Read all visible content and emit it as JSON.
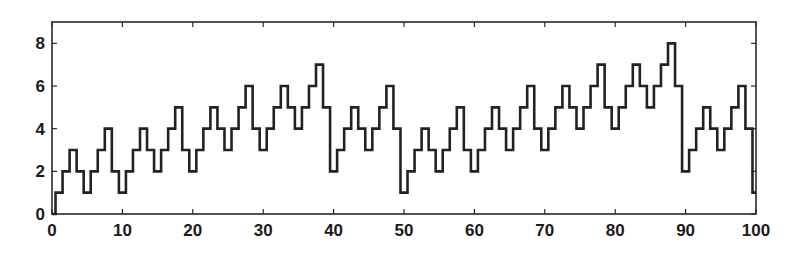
{
  "chart_data": {
    "type": "line",
    "style": "stairs-centered",
    "title": "",
    "xlabel": "",
    "ylabel": "",
    "xlim": [
      0,
      100
    ],
    "ylim": [
      0,
      9
    ],
    "xticks": [
      0,
      10,
      20,
      30,
      40,
      50,
      60,
      70,
      80,
      90,
      100
    ],
    "yticks": [
      0,
      2,
      4,
      6,
      8
    ],
    "grid": false,
    "legend": null,
    "series": [
      {
        "name": "series-1",
        "color": "#222222",
        "x": [
          0,
          1,
          2,
          3,
          4,
          5,
          6,
          7,
          8,
          9,
          10,
          11,
          12,
          13,
          14,
          15,
          16,
          17,
          18,
          19,
          20,
          21,
          22,
          23,
          24,
          25,
          26,
          27,
          28,
          29,
          30,
          31,
          32,
          33,
          34,
          35,
          36,
          37,
          38,
          39,
          40,
          41,
          42,
          43,
          44,
          45,
          46,
          47,
          48,
          49,
          50,
          51,
          52,
          53,
          54,
          55,
          56,
          57,
          58,
          59,
          60,
          61,
          62,
          63,
          64,
          65,
          66,
          67,
          68,
          69,
          70,
          71,
          72,
          73,
          74,
          75,
          76,
          77,
          78,
          79,
          80,
          81,
          82,
          83,
          84,
          85,
          86,
          87,
          88,
          89,
          90,
          91,
          92,
          93,
          94,
          95,
          96,
          97,
          98,
          99,
          100
        ],
        "values": [
          0,
          1,
          2,
          3,
          2,
          1,
          2,
          3,
          4,
          2,
          1,
          2,
          3,
          4,
          3,
          2,
          3,
          4,
          5,
          3,
          2,
          3,
          4,
          5,
          4,
          3,
          4,
          5,
          6,
          4,
          3,
          4,
          5,
          6,
          5,
          4,
          5,
          6,
          7,
          5,
          2,
          3,
          4,
          5,
          4,
          3,
          4,
          5,
          6,
          4,
          1,
          2,
          3,
          4,
          3,
          2,
          3,
          4,
          5,
          3,
          2,
          3,
          4,
          5,
          4,
          3,
          4,
          5,
          6,
          4,
          3,
          4,
          5,
          6,
          5,
          4,
          5,
          6,
          7,
          5,
          4,
          5,
          6,
          7,
          6,
          5,
          6,
          7,
          8,
          6,
          2,
          3,
          4,
          5,
          4,
          3,
          4,
          5,
          6,
          4,
          1
        ]
      }
    ]
  },
  "axes": {
    "x_tick_labels": [
      "0",
      "10",
      "20",
      "30",
      "40",
      "50",
      "60",
      "70",
      "80",
      "90",
      "100"
    ],
    "y_tick_labels": [
      "0",
      "2",
      "4",
      "6",
      "8"
    ]
  }
}
